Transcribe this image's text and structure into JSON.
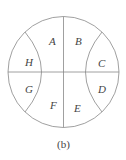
{
  "diagram": {
    "caption": "(b)",
    "regions": {
      "A": "A",
      "B": "B",
      "C": "C",
      "D": "D",
      "E": "E",
      "F": "F",
      "G": "G",
      "H": "H"
    }
  }
}
